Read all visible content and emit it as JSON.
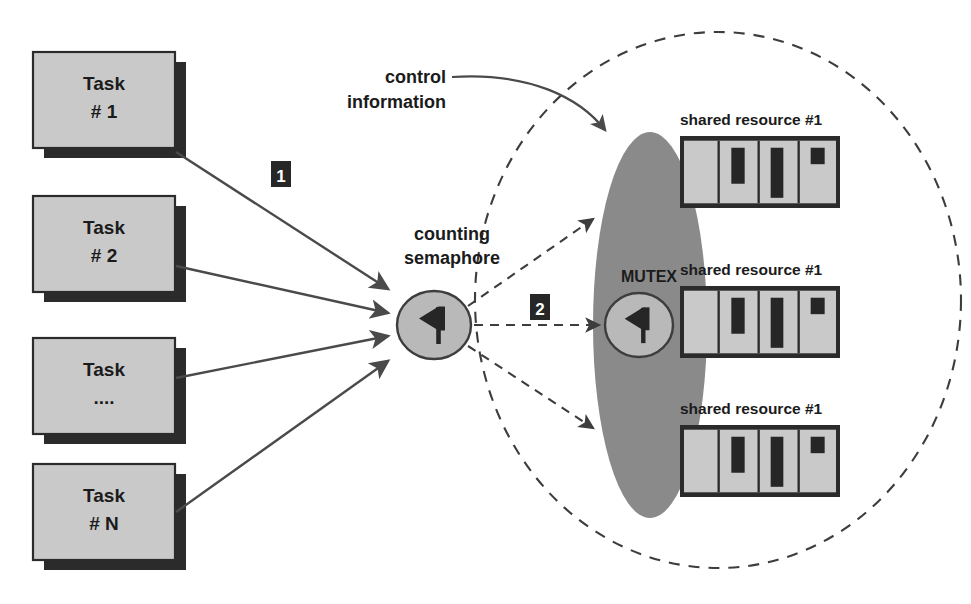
{
  "diagram": {
    "colors": {
      "box_fill": "#c9c9c9",
      "box_stroke": "#2b2b2b",
      "shadow": "#2b2b2b",
      "ellipse_fill": "#8a8a8a",
      "line": "#4a4a4a",
      "badge_fill": "#272727",
      "badge_text": "#ffffff",
      "text": "#1b1b1b",
      "resource_slot_dark": "#262626",
      "background": "#ffffff"
    }
  },
  "tasks": [
    {
      "line1": "Task",
      "line2": "# 1"
    },
    {
      "line1": "Task",
      "line2": "# 2"
    },
    {
      "line1": "Task",
      "line2": "...."
    },
    {
      "line1": "Task",
      "line2": "# N"
    }
  ],
  "semaphore": {
    "label_line1": "counting",
    "label_line2": "semaphore",
    "icon": "flag-icon"
  },
  "mutex": {
    "label": "MUTEX",
    "icon": "flag-icon"
  },
  "control": {
    "label_line1": "control",
    "label_line2": "information"
  },
  "badges": [
    {
      "text": "1"
    },
    {
      "text": "2"
    }
  ],
  "resources": [
    {
      "label": "shared resource #1"
    },
    {
      "label": "shared resource #1"
    },
    {
      "label": "shared resource #1"
    }
  ]
}
